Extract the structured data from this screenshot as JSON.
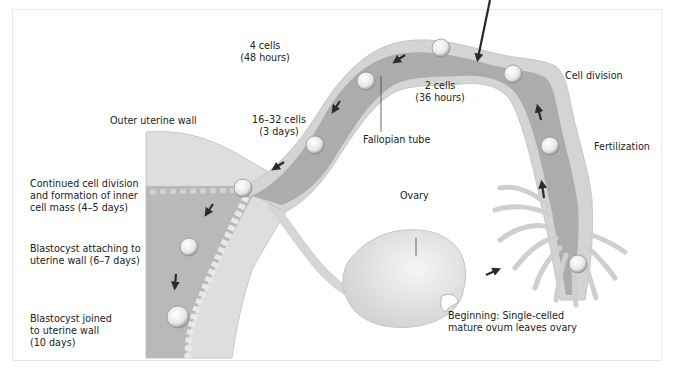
{
  "diagram": {
    "labels": {
      "four_cells": "4 cells\n(48 hours)",
      "two_cells": "2 cells\n(36 hours)",
      "cell_division": "Cell division",
      "fallopian_tube": "Fallopian tube",
      "sixteen_cells": "16–32 cells\n(3 days)",
      "outer_uterine_wall": "Outer uterine wall",
      "fertilization": "Fertilization",
      "continued_division": "Continued cell division\nand formation of inner\ncell mass (4–5 days)",
      "ovary": "Ovary",
      "blastocyst_attaching": "Blastocyst attaching to\nuterine wall (6–7 days)",
      "blastocyst_joined": "Blastocyst joined\nto uterine wall\n(10 days)",
      "beginning": "Beginning: Single-celled\nmature ovum leaves ovary"
    },
    "stages": [
      {
        "order": 1,
        "name": "Beginning",
        "description": "Single-celled mature ovum leaves ovary"
      },
      {
        "order": 2,
        "name": "Fertilization"
      },
      {
        "order": 3,
        "name": "Cell division"
      },
      {
        "order": 4,
        "name": "2 cells",
        "time": "36 hours"
      },
      {
        "order": 5,
        "name": "4 cells",
        "time": "48 hours"
      },
      {
        "order": 6,
        "name": "16–32 cells",
        "time": "3 days"
      },
      {
        "order": 7,
        "name": "Continued cell division and formation of inner cell mass",
        "time": "4–5 days"
      },
      {
        "order": 8,
        "name": "Blastocyst attaching to uterine wall",
        "time": "6–7 days"
      },
      {
        "order": 9,
        "name": "Blastocyst joined to uterine wall",
        "time": "10 days"
      }
    ],
    "colors": {
      "tube_outer": "#d6d6d6",
      "tube_inner": "#a9a9a9",
      "uterus_wall": "#dcdcdc",
      "uterus_cavity": "#b8b8b8",
      "ovary": "#e4e4e4",
      "arrow": "#2a2a2a",
      "text": "#222222"
    }
  }
}
